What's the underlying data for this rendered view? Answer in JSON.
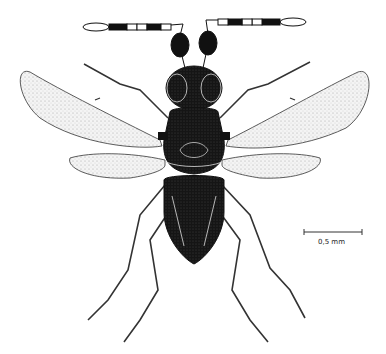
{
  "figure": {
    "scale_bar": {
      "label": "0,5 mm"
    },
    "colors": {
      "ink": "#111111",
      "wing": "#f2f2f2",
      "background": "#ffffff"
    }
  }
}
